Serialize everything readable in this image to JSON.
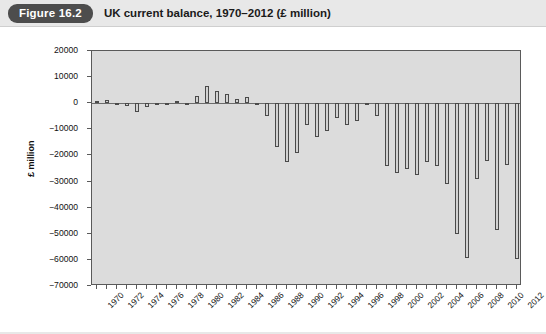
{
  "header": {
    "figure_badge": "Figure 16.2",
    "title": "UK current balance, 1970–2012 (£ million)",
    "badge_color": "#4d4d4d",
    "badge_text_color": "#ffffff",
    "band_color": "#e8e8e8"
  },
  "chart_data": {
    "type": "bar",
    "title": "UK current balance, 1970–2012 (£ million)",
    "xlabel": "",
    "ylabel": "£ million",
    "ylim": [
      -70000,
      20000
    ],
    "ytick_step": 10000,
    "ytick_labels": [
      "20000",
      "10000",
      "0",
      "−10000",
      "−20000",
      "−30000",
      "−40000",
      "−50000",
      "−60000",
      "−70000"
    ],
    "ytick_values": [
      20000,
      10000,
      0,
      -10000,
      -20000,
      -30000,
      -40000,
      -50000,
      -60000,
      -70000
    ],
    "xtick_labels": [
      "1970",
      "1972",
      "1974",
      "1976",
      "1978",
      "1980",
      "1982",
      "1984",
      "1986",
      "1988",
      "1990",
      "1992",
      "1994",
      "1996",
      "1998",
      "2000",
      "2002",
      "2004",
      "2006",
      "2008",
      "2010",
      "2012"
    ],
    "xtick_label_every": 2,
    "grid": false,
    "legend": null,
    "plot_background": "#dcdcdc",
    "bar_fill": "#d2d2d2",
    "bar_edge": "#4a4a4a",
    "categories": [
      1970,
      1971,
      1972,
      1973,
      1974,
      1975,
      1976,
      1977,
      1978,
      1979,
      1980,
      1981,
      1982,
      1983,
      1984,
      1985,
      1986,
      1987,
      1988,
      1989,
      1990,
      1991,
      1992,
      1993,
      1994,
      1995,
      1996,
      1997,
      1998,
      1999,
      2000,
      2001,
      2002,
      2003,
      2004,
      2005,
      2006,
      2007,
      2008,
      2009,
      2010,
      2011,
      2012
    ],
    "values": [
      900,
      1100,
      200,
      -1000,
      -3200,
      -1500,
      -800,
      100,
      1000,
      -500,
      2800,
      6500,
      4600,
      3500,
      1500,
      2200,
      -800,
      -5000,
      -16600,
      -22400,
      -19000,
      -8200,
      -12900,
      -10700,
      -5600,
      -8300,
      -7000,
      -700,
      -5000,
      -24000,
      -26800,
      -25100,
      -27300,
      -22600,
      -24000,
      -31000,
      -50000,
      -59300,
      -29000,
      -22000,
      -48500,
      -23500,
      -59500
    ],
    "deepest_year": 2012,
    "deepest_value": -59500,
    "peak_year": 1981,
    "peak_value": 6500
  }
}
